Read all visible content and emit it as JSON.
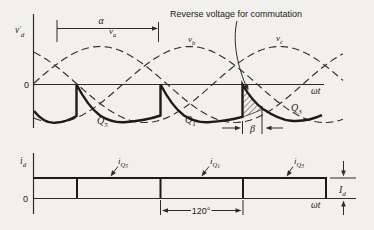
{
  "figure": {
    "annotation": "Reverse voltage for commutation",
    "top_plot": {
      "y_axis_label": {
        "base": "v",
        "prime": "′",
        "sub": "d"
      },
      "origin_label": "0",
      "x_axis_label": "ωt",
      "alpha_label": "α",
      "beta_label": "β",
      "phase_labels": [
        {
          "base": "v",
          "sub": "a"
        },
        {
          "base": "v",
          "sub": "b"
        },
        {
          "base": "v",
          "sub": "c"
        }
      ],
      "thyristor_labels": [
        {
          "base": "Q",
          "sub": "5"
        },
        {
          "base": "Q",
          "sub": "1"
        },
        {
          "base": "Q",
          "sub": "3"
        }
      ]
    },
    "bottom_plot": {
      "y_axis_label": {
        "base": "i",
        "sub": "d"
      },
      "origin_label": "0",
      "x_axis_label": "ωt",
      "current_labels": [
        {
          "base": "i",
          "sub": "Q",
          "subsub": "5"
        },
        {
          "base": "i",
          "sub": "Q",
          "subsub": "1"
        },
        {
          "base": "i",
          "sub": "Q",
          "subsub": "3"
        }
      ],
      "span_label": "120°",
      "amplitude_label": {
        "base": "I",
        "sub": "d"
      }
    }
  },
  "chart_data": {
    "type": "line",
    "x_axis": "ωt",
    "plots": [
      {
        "name": "output-voltage",
        "y_label": "v′d",
        "series": [
          {
            "name": "va",
            "type": "sinusoid",
            "phase_deg": 0,
            "style": "dashed"
          },
          {
            "name": "vb",
            "type": "sinusoid",
            "phase_deg": -120,
            "style": "dashed"
          },
          {
            "name": "vc",
            "type": "sinusoid",
            "phase_deg": -240,
            "style": "dashed"
          }
        ],
        "output_waveform": "v′d follows negative scallops of the phase voltages (inverter mode); vertical jumps up to zero at each commutation, every 120°",
        "conducting_devices": [
          "Q5",
          "Q1",
          "Q3"
        ],
        "markers": {
          "alpha": "delay angle α spanning ~120° near top",
          "beta": "extinction angle β after last commutation",
          "hatched_area": "Reverse voltage for commutation"
        }
      },
      {
        "name": "dc-side-current",
        "y_label": "id",
        "waveform": "constant amplitude Id, continuous conduction",
        "segments": [
          "iQ5",
          "iQ1",
          "iQ3"
        ],
        "conduction_deg": 120,
        "amplitude": "Id"
      }
    ]
  }
}
